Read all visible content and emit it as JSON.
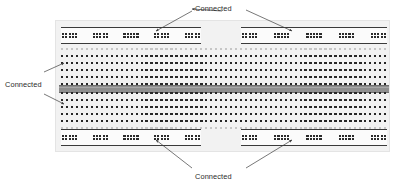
{
  "figure": {
    "type": "breadboard-diagram",
    "background_color": "#ffffff",
    "board": {
      "name": "solderless-breadboard",
      "body_color": "#f2f2f2",
      "x": 55,
      "y": 20,
      "width": 335,
      "height": 132
    }
  },
  "labels": [
    {
      "id": "top",
      "text": "Connected",
      "x": 195,
      "y": 4,
      "points_to": [
        "top-left-power-rail",
        "top-right-power-rail"
      ]
    },
    {
      "id": "left",
      "text": "Connected",
      "x": 5,
      "y": 80,
      "points_to": [
        "upper-terminal-strip",
        "lower-terminal-strip"
      ]
    },
    {
      "id": "bottom",
      "text": "Connected",
      "x": 195,
      "y": 172,
      "points_to": [
        "bottom-left-power-rail",
        "bottom-right-power-rail"
      ]
    }
  ],
  "power_rails": {
    "rail_line_color": "#3a3a3a",
    "hole_color": "#2b2b2b",
    "rows_per_rail": 2,
    "groups_per_rail": 5,
    "holes_per_group": 5,
    "rails": [
      {
        "name": "top-left-power-rail",
        "x": 60,
        "y": 26,
        "width": 140
      },
      {
        "name": "top-right-power-rail",
        "x": 240,
        "y": 26,
        "width": 146
      },
      {
        "name": "bottom-left-power-rail",
        "x": 60,
        "y": 128,
        "width": 140
      },
      {
        "name": "bottom-right-power-rail",
        "x": 240,
        "y": 128,
        "width": 146
      }
    ]
  },
  "terminal_strips": {
    "hole_color": "#262626",
    "guide_hole_color": "#c6c6c6",
    "columns": 66,
    "contact_rows": 5,
    "guide_rows": 1,
    "strips": [
      {
        "name": "upper-terminal-strip",
        "x": 60,
        "y": 47,
        "width": 326,
        "height": 37,
        "guide_position": "top"
      },
      {
        "name": "lower-terminal-strip",
        "x": 60,
        "y": 91,
        "width": 326,
        "height": 37,
        "guide_position": "bottom"
      }
    ]
  },
  "center_channel": {
    "name": "center-channel",
    "color": "#8f8f8f",
    "x": 58,
    "y": 84,
    "width": 330,
    "height": 6
  },
  "arrows": {
    "color": "#3d3d3d",
    "stroke_width": 0.7,
    "list": [
      {
        "name": "arrow-top-to-left-rail",
        "x1": 222,
        "y1": 11,
        "x2": 192,
        "y2": 9,
        "head": "start"
      },
      {
        "name": "arrow-top-to-left-rail-2",
        "x1": 192,
        "y1": 11,
        "x2": 156,
        "y2": 31
      },
      {
        "name": "arrow-top-to-right-rail",
        "x1": 246,
        "y1": 10,
        "x2": 292,
        "y2": 31
      },
      {
        "name": "arrow-left-to-upper-strip",
        "x1": 44,
        "y1": 72,
        "x2": 64,
        "y2": 63
      },
      {
        "name": "arrow-left-to-lower-strip",
        "x1": 44,
        "y1": 94,
        "x2": 64,
        "y2": 104
      },
      {
        "name": "arrow-bottom-to-left-rail",
        "x1": 192,
        "y1": 168,
        "x2": 156,
        "y2": 140
      },
      {
        "name": "arrow-bottom-to-right-rail",
        "x1": 246,
        "y1": 168,
        "x2": 292,
        "y2": 140
      }
    ]
  }
}
